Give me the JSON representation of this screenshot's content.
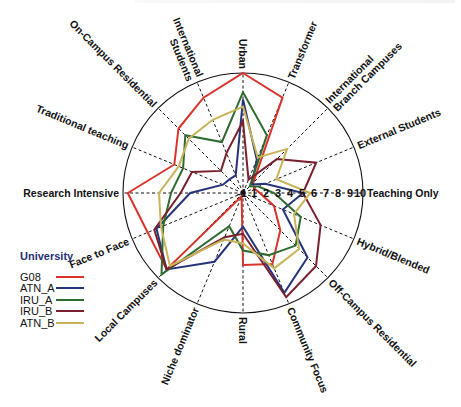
{
  "chart_data": {
    "type": "radar",
    "title": "",
    "scale": {
      "min": 0,
      "max": 10,
      "center_label": "-1",
      "tick_labels": [
        "1",
        "2",
        "3",
        "4",
        "5",
        "6",
        "7",
        "8",
        "9",
        "10"
      ]
    },
    "axes": [
      "Urban",
      "Transformer",
      "International Branch Campuses",
      "External Students",
      "Teaching Only",
      "Hybrid/Blended",
      "Off-Campus Residential",
      "Community Focus",
      "Rural",
      "Niche dominator",
      "Local Campuses",
      "Face to Face",
      "Research Intensive",
      "Traditional teaching",
      "On-Campus Residential",
      "International Students"
    ],
    "axis_label_lines": [
      [
        "Urban"
      ],
      [
        "Transformer"
      ],
      [
        "International",
        "Branch Campuses"
      ],
      [
        "External Students"
      ],
      [
        "Teaching Only"
      ],
      [
        "Hybrid/Blended"
      ],
      [
        "Off-Campus Residential"
      ],
      [
        "Community Focus"
      ],
      [
        "Rural"
      ],
      [
        "Niche dominator"
      ],
      [
        "Local Campuses"
      ],
      [
        "Face to Face"
      ],
      [
        "Research Intensive"
      ],
      [
        "Traditional teaching"
      ],
      [
        "On-Campus Residential"
      ],
      [
        "International",
        "Students"
      ]
    ],
    "series": [
      {
        "name": "G08",
        "color": "#d9342b",
        "values": [
          10,
          8.6,
          1.2,
          1.0,
          1.4,
          2.8,
          4.4,
          6.4,
          6.0,
          0.3,
          9.0,
          8.6,
          9.6,
          6.2,
          7.6,
          8.6
        ]
      },
      {
        "name": "ATN_A",
        "color": "#27337a",
        "values": [
          7.8,
          3.0,
          1.0,
          2.0,
          5.0,
          3.6,
          7.6,
          9.0,
          2.8,
          6.2,
          9.0,
          7.8,
          4.4,
          1.8,
          1.6,
          1.6
        ]
      },
      {
        "name": "IRU_A",
        "color": "#2e6b2e",
        "values": [
          8.4,
          5.2,
          0.8,
          1.4,
          2.6,
          5.2,
          6.2,
          5.6,
          4.8,
          3.0,
          9.6,
          7.2,
          6.0,
          5.4,
          6.8,
          4.6
        ]
      },
      {
        "name": "IRU_B",
        "color": "#7a1f2e",
        "values": [
          6.0,
          1.2,
          4.0,
          6.6,
          5.0,
          7.0,
          8.6,
          9.4,
          3.4,
          4.0,
          9.0,
          8.0,
          5.2,
          4.6,
          2.6,
          3.6
        ]
      },
      {
        "name": "ATN_B",
        "color": "#c8b45a",
        "values": [
          7.2,
          3.2,
          5.2,
          3.0,
          5.6,
          4.6,
          6.6,
          6.8,
          4.2,
          4.2,
          8.6,
          7.4,
          7.0,
          5.8,
          6.4,
          6.6
        ]
      }
    ],
    "xlabel": "",
    "ylabel": "",
    "grid": "dashed radial spokes, outer circle",
    "legend_position": "left-bottom"
  },
  "legend": {
    "title": "University",
    "items": [
      {
        "label": "G08",
        "color": "#d9342b"
      },
      {
        "label": "ATN_A",
        "color": "#27337a"
      },
      {
        "label": "IRU_A",
        "color": "#2e6b2e"
      },
      {
        "label": "IRU_B",
        "color": "#7a1f2e"
      },
      {
        "label": "ATN_B",
        "color": "#c8b45a"
      }
    ]
  }
}
